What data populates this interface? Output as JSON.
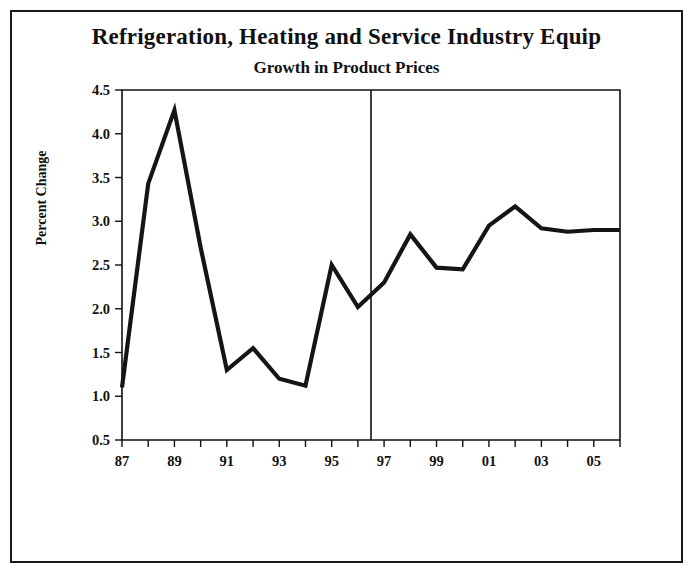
{
  "chart_data": {
    "type": "line",
    "title": "Refrigeration, Heating and Service Industry Equip",
    "subtitle": "Growth in Product Prices",
    "xlabel": "",
    "ylabel": "Percent Change",
    "ylim": [
      0.5,
      4.5
    ],
    "yticks": [
      "0.5",
      "1.0",
      "1.5",
      "2.0",
      "2.5",
      "3.0",
      "3.5",
      "4.0",
      "4.5"
    ],
    "ytick_values": [
      0.5,
      1.0,
      1.5,
      2.0,
      2.5,
      3.0,
      3.5,
      4.0,
      4.5
    ],
    "xlim": [
      1987,
      1993
    ],
    "x": [
      1987,
      1988,
      1989,
      1990,
      1991,
      1992,
      1993,
      1994,
      1995,
      1996,
      1997,
      1998,
      1999,
      2000,
      2001,
      2002,
      2003,
      2004,
      2005,
      2006
    ],
    "xtick_labels": [
      "87",
      "",
      "89",
      "",
      "91",
      "",
      "93",
      "",
      "95",
      "",
      "97",
      "",
      "99",
      "",
      "01",
      "",
      "03",
      "",
      "05",
      ""
    ],
    "xtick_labels_visible": [
      "87",
      "89",
      "91",
      "93",
      "95",
      "97",
      "99",
      "01",
      "03",
      "05"
    ],
    "values": [
      1.1,
      3.43,
      4.27,
      2.7,
      1.3,
      1.55,
      1.2,
      1.12,
      2.5,
      2.02,
      2.3,
      2.85,
      2.47,
      2.45,
      2.95,
      3.17,
      2.92,
      2.88,
      2.9,
      2.9
    ],
    "series": [
      {
        "name": "Percent Change",
        "values": [
          1.1,
          3.43,
          4.27,
          2.7,
          1.3,
          1.55,
          1.2,
          1.12,
          2.5,
          2.02,
          2.3,
          2.85,
          2.47,
          2.45,
          2.95,
          3.17,
          2.92,
          2.88,
          2.9,
          2.9
        ]
      }
    ],
    "annotations": [
      {
        "type": "vertical-divider",
        "x": 1996.5,
        "label": "forecast-divider"
      }
    ],
    "grid": false,
    "legend": "none",
    "line_color": "#151515"
  }
}
